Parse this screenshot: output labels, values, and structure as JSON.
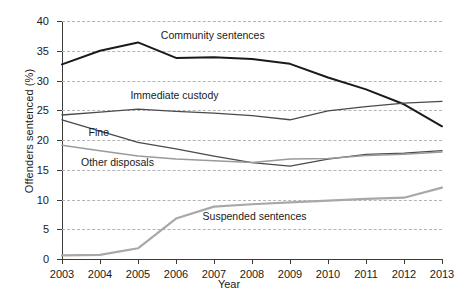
{
  "chart_data": {
    "type": "line",
    "title": "",
    "xlabel": "Year",
    "ylabel": "Offenders sentenced (%)",
    "categories": [
      2003,
      2004,
      2005,
      2006,
      2007,
      2008,
      2009,
      2010,
      2011,
      2012,
      2013
    ],
    "x_tick_labels": [
      "2003",
      "2004",
      "2005",
      "2006",
      "2007",
      "2008",
      "2009",
      "2010",
      "2011",
      "2012",
      "2013"
    ],
    "y_tick_labels": [
      "0",
      "5",
      "10",
      "15",
      "20",
      "25",
      "30",
      "35",
      "40"
    ],
    "y_ticks": [
      0,
      5,
      10,
      15,
      20,
      25,
      30,
      35,
      40
    ],
    "ylim": [
      0,
      40
    ],
    "grid": "horizontal-dashed",
    "legend_position": "inline-annotations",
    "series": [
      {
        "name": "Community sentences",
        "color": "#1a1a1a",
        "width": 2.0,
        "values": [
          32.7,
          35.0,
          36.4,
          33.8,
          33.9,
          33.6,
          32.8,
          30.5,
          28.5,
          26.0,
          22.3
        ],
        "label_x": 2005.6,
        "label_y": 37.5
      },
      {
        "name": "Immediate custody",
        "color": "#4a4a4a",
        "width": 1.3,
        "values": [
          24.2,
          24.7,
          25.2,
          24.8,
          24.5,
          24.1,
          23.4,
          24.9,
          25.6,
          26.2,
          26.5
        ],
        "label_x": 2004.8,
        "label_y": 27.4
      },
      {
        "name": "Fine",
        "color": "#4a4a4a",
        "width": 1.3,
        "values": [
          23.4,
          21.5,
          19.6,
          18.5,
          17.3,
          16.2,
          15.6,
          16.8,
          17.6,
          17.8,
          18.2
        ],
        "label_x": 2003.7,
        "label_y": 21.2
      },
      {
        "name": "Other disposals",
        "color": "#9a9a9a",
        "width": 1.5,
        "values": [
          19.1,
          18.2,
          17.3,
          16.8,
          16.5,
          16.2,
          16.8,
          16.9,
          17.4,
          17.6,
          18.0
        ],
        "label_x": 2003.5,
        "label_y": 16.2
      },
      {
        "name": "Suspended sentences",
        "color": "#a8a8a8",
        "width": 2.2,
        "values": [
          0.6,
          0.7,
          1.8,
          6.8,
          8.8,
          9.2,
          9.5,
          9.8,
          10.1,
          10.3,
          12.0
        ],
        "label_x": 2006.7,
        "label_y": 7.1
      }
    ]
  }
}
